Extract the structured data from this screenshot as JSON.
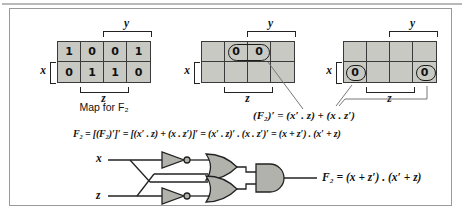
{
  "kmaps": [
    {
      "x_label": "x",
      "y_label": "y",
      "z_label": "z",
      "caption": "Map for F₂",
      "cells": [
        [
          "1",
          "0",
          "0",
          "1"
        ],
        [
          "0",
          "1",
          "1",
          "0"
        ]
      ]
    },
    {
      "x_label": "x",
      "y_label": "y",
      "z_label": "z",
      "cells": [
        [
          "",
          "0",
          "0",
          ""
        ],
        [
          "",
          "",
          "",
          ""
        ]
      ],
      "group": "x'·z (two 0s circled, top row middle)"
    },
    {
      "x_label": "x",
      "y_label": "y",
      "z_label": "z",
      "cells": [
        [
          "",
          "",
          "",
          ""
        ],
        [
          "0",
          "",
          "",
          "0"
        ]
      ],
      "group": "x·z' (two 0s circled, bottom corners wrap)"
    }
  ],
  "formulas": {
    "complement": "(F₂)′ = (x′ . z) + (x . z′)",
    "derivation": "F₂ = [(F₂)′]′ = [(x′ . z) + (x . z′)]′ = (x′ . z)′ . (x . z′)′ = (x + z′) . (x′ + z)"
  },
  "circuit": {
    "input_x": "x",
    "input_z": "z",
    "output": "F₂ = (x + z′) . (x′ + z)",
    "gates": [
      "not",
      "not",
      "or",
      "or",
      "and"
    ]
  },
  "colors": {
    "cell_fill": "#c9c9c3",
    "gate_fill": "#b2b2ac",
    "panel_border": "#9a9a9a"
  }
}
